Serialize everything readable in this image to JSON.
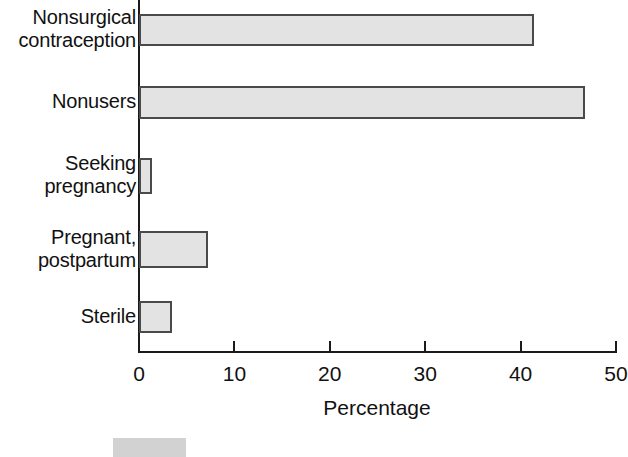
{
  "chart_data": {
    "type": "bar",
    "orientation": "horizontal",
    "title": "",
    "subtitle": "",
    "xlabel": "Percentage",
    "ylabel": "",
    "categories": [
      "Nonsurgical\ncontraception",
      "Nonusers",
      "Seeking\npregnancy",
      "Pregnant,\npostpartum",
      "Sterile"
    ],
    "values": [
      41.4,
      46.7,
      1.4,
      7.2,
      3.5
    ],
    "xlim": [
      0,
      50
    ],
    "xticks": [
      0,
      10,
      20,
      30,
      40,
      50
    ],
    "xtick_labels": [
      "0",
      "10",
      "20",
      "30",
      "40",
      "50"
    ],
    "grid": false,
    "legend": {
      "position": "bottom-left",
      "entries": [
        {
          "label": "",
          "color": "#d2d2d2"
        }
      ]
    },
    "style": {
      "bar_fill": "#e3e3e3",
      "bar_edge": "#4a4a4a",
      "axis_color": "#1a1a1a",
      "text_color": "#111111",
      "background": "#ffffff"
    }
  },
  "axis": {
    "x_title": "Percentage"
  }
}
